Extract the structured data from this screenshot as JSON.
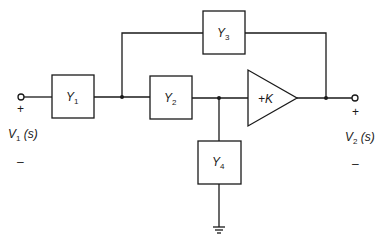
{
  "diagram": {
    "type": "circuit-block-diagram",
    "blocks": [
      {
        "id": "Y1",
        "label": "Y",
        "subscript": "1"
      },
      {
        "id": "Y2",
        "label": "Y",
        "subscript": "2"
      },
      {
        "id": "Y3",
        "label": "Y",
        "subscript": "3"
      },
      {
        "id": "Y4",
        "label": "Y",
        "subscript": "4"
      }
    ],
    "amplifier": {
      "label": "+K"
    },
    "input": {
      "label": "V",
      "subscript": "1",
      "arg": " (s)",
      "plus": "+",
      "minus": "–"
    },
    "output": {
      "label": "V",
      "subscript": "2",
      "arg": " (s)",
      "plus": "+",
      "minus": "–"
    },
    "ground": {
      "symbol": "ground"
    }
  }
}
